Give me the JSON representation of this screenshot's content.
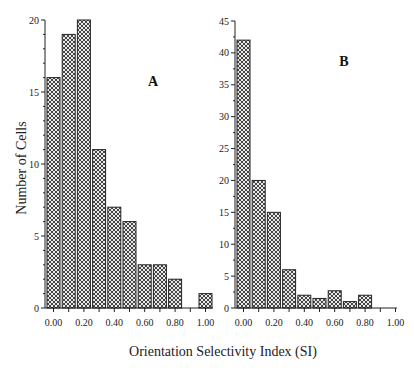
{
  "figure": {
    "xlabel": "Orientation Selectivity Index  (SI)",
    "ylabel": "Number of Cells"
  },
  "chart_data": [
    {
      "type": "bar",
      "panel": "A",
      "title": "A",
      "xlabel": "Orientation Selectivity Index (SI)",
      "ylabel": "Number of Cells",
      "categories": [
        "0.00",
        "0.10",
        "0.20",
        "0.30",
        "0.40",
        "0.50",
        "0.60",
        "0.70",
        "0.80",
        "0.90",
        "1.00"
      ],
      "values": [
        16,
        19,
        20,
        11,
        7,
        6,
        3,
        3,
        2,
        0,
        1
      ],
      "xtick_labels": [
        "0.00",
        "0.20",
        "0.40",
        "0.60",
        "0.80",
        "1.00"
      ],
      "ytick_labels": [
        "0",
        "5",
        "10",
        "15",
        "20"
      ],
      "ylim": [
        0,
        20
      ],
      "grid": false,
      "fill": "crosshatch"
    },
    {
      "type": "bar",
      "panel": "B",
      "title": "B",
      "xlabel": "Orientation Selectivity Index (SI)",
      "ylabel": "Number of Cells",
      "categories": [
        "0.00",
        "0.10",
        "0.20",
        "0.30",
        "0.40",
        "0.50",
        "0.60",
        "0.70",
        "0.80",
        "0.90",
        "1.00"
      ],
      "values": [
        42,
        20,
        15,
        6,
        2,
        1.5,
        2.7,
        1,
        2,
        0,
        0
      ],
      "xtick_labels": [
        "0.00",
        "0.20",
        "0.40",
        "0.60",
        "0.80",
        "1.00"
      ],
      "ytick_labels": [
        "0",
        "5",
        "10",
        "15",
        "20",
        "25",
        "30",
        "35",
        "40",
        "45"
      ],
      "ylim": [
        0,
        45
      ],
      "grid": false,
      "fill": "crosshatch"
    }
  ]
}
